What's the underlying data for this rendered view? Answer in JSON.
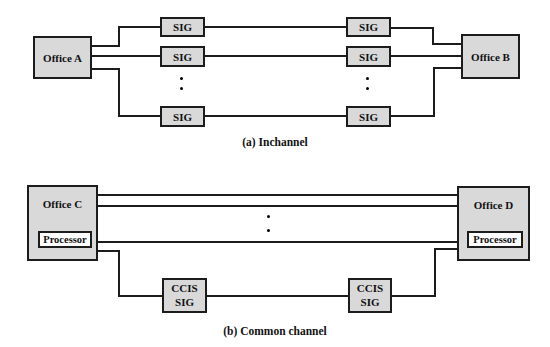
{
  "colors": {
    "box_fill": "#d9d9d9",
    "box_border": "#1c1c1c",
    "line": "#1c1c1c",
    "processor_fill": "#ffffff",
    "text": "#111111",
    "background": "#ffffff"
  },
  "diagram_a": {
    "caption": "(a) Inchannel",
    "office_left_label": "Office A",
    "office_right_label": "Office B",
    "sig_label": "SIG",
    "visible_sig_pairs": 3,
    "trunk_rows_shown": 3,
    "ellipsis_dots_per_column": 2
  },
  "diagram_b": {
    "caption": "(b) Common channel",
    "office_left_label": "Office C",
    "office_right_label": "Office D",
    "processor_label": "Processor",
    "ccis_sig_line1": "CCIS",
    "ccis_sig_line2": "SIG",
    "trunk_lines_shown": 3,
    "ellipsis_dots": 2
  }
}
